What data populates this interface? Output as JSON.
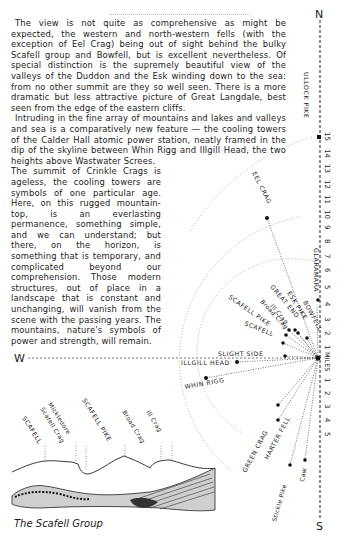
{
  "text": {
    "paragraph1": "The view is not quite as comprehensive as might be expected, the western and north-western fells (with the exception of Eel Crag) being out of sight behind the bulky Scafell group and Bowfell, but is excellent nevertheless. Of special distinction is the supremely beautiful view of the valleys of the Duddon and the Esk winding down to the sea: from no other summit are they so well seen. There is a more dramatic but less attractive picture of Great Langdale, best seen from the edge of the eastern cliffs.",
    "paragraph2a": "Intruding in the fine array of mountains and lakes and valleys and sea is a comparatively new feature — the cooling towers of the Calder Hall atomic power station, neatly framed in the dip of the skyline between Whin Rigg and Illgill Head, the two heights above Wastwater Screes.",
    "paragraph2b": "The summit of Crinkle Crags is ageless, the cooling towers are symbols of one particular age. Here, on this rugged mountain-top, is an everlasting permanence, something simple, and we can understand; but there, on the horizon, is something that is temporary, and complicated beyond our comprehension. Those modern structures, out of place in a landscape that is constant and unchanging, will vanish from the scene with the passing years. The mountains, nature's symbols of power and strength, will remain."
  },
  "compass": {
    "north": "N",
    "south": "S",
    "west": "W"
  },
  "scale": {
    "label": "MILES",
    "north_ticks": [
      "1",
      "2",
      "3",
      "4",
      "5",
      "6",
      "7",
      "8",
      "9",
      "10",
      "11",
      "12",
      "13",
      "14",
      "15"
    ],
    "south_ticks": [
      "1",
      "2",
      "3",
      "4",
      "5"
    ]
  },
  "summits": {
    "ullock_pike": "ULLOCK PIKE",
    "eel_crag": "EEL CRAG",
    "glaramara": "GLARAMARA",
    "bowfell": "BOWFELL",
    "esk_pike": "ESK PIKE",
    "great_end": "GREAT END",
    "ill_crag": "Ill Crag",
    "broad_crag": "Broad Crag",
    "scafell_pike": "SCAFELL PIKE",
    "scafell": "SCAFELL",
    "slight_side": "SLIGHT SIDE",
    "illgill_head": "ILLGILL HEAD",
    "whin_rigg": "WHIN RIGG",
    "green_crag": "GREEN CRAG",
    "harter_fell": "HARTER FELL",
    "stickle_pike": "Stickle Pike",
    "caw": "Caw"
  },
  "sketch": {
    "labels": {
      "scafell": "SCAFELL",
      "mickledore": "Mickledore",
      "scafell_crag": "Scafell Crag",
      "scafell_pike": "SCAFELL PIKE",
      "broad_crag": "Broad Crag",
      "ill_crag": "Ill Crag"
    },
    "caption": "The Scafell Group"
  }
}
